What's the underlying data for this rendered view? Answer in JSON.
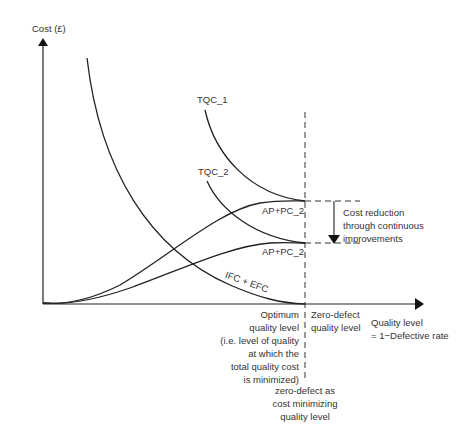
{
  "diagram": {
    "title": "",
    "y_axis_label": "Cost (£)",
    "x_axis_label_line1": "Quality level",
    "x_axis_label_line2": "= 1−Defective rate",
    "curves": {
      "tqc1": "TQC_1",
      "tqc2": "TQC_2",
      "ap_pc_upper": "AP+PC_2",
      "ap_pc_lower": "AP+PC_2",
      "ifc_efc": "IFC + EFC"
    },
    "annotations": {
      "cost_reduction_1": "Cost reduction",
      "cost_reduction_2": "through continuous",
      "cost_reduction_3": "improvements",
      "optimum_1": "Optimum",
      "optimum_2": "quality level",
      "optimum_3": "(i.e. level of quality",
      "optimum_4": "at which the",
      "optimum_5": "total quality cost",
      "optimum_6": "is minimized)",
      "zero_defect_1": "Zero-defect",
      "zero_defect_2": "quality level",
      "zero_cost_1": "zero-defect as",
      "zero_cost_2": "cost minimizing",
      "zero_cost_3": "quality level"
    },
    "colors": {
      "line": "#222222",
      "text": "#333333",
      "background": "#ffffff"
    }
  }
}
